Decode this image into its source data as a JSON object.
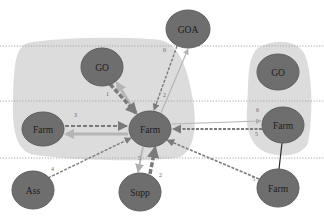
{
  "diagram": {
    "type": "network-flow",
    "colors": {
      "node_fill": "#6e6e6e",
      "node_stroke": "#5a5a5a",
      "region_fill": "#dcdcdc",
      "dotted_line": "#9a9a9a",
      "edge_dark": "#7a7a7a",
      "edge_light": "#b0b0b0",
      "solid_edge": "#2a2a2a"
    },
    "regions": [
      {
        "id": "left-cluster",
        "label": ""
      },
      {
        "id": "right-cluster",
        "label": ""
      }
    ],
    "dotted_guides": [
      {
        "y": 46
      },
      {
        "y": 101
      },
      {
        "y": 158
      }
    ],
    "nodes": [
      {
        "id": "goa",
        "label": "GOA",
        "cx": 188,
        "cy": 29,
        "rx": 22,
        "ry": 19
      },
      {
        "id": "go-left",
        "label": "GO",
        "cx": 102,
        "cy": 67,
        "rx": 21,
        "ry": 19
      },
      {
        "id": "go-right",
        "label": "GO",
        "cx": 278,
        "cy": 72,
        "rx": 21,
        "ry": 18
      },
      {
        "id": "farm-left",
        "label": "Farm",
        "cx": 43,
        "cy": 129,
        "rx": 21,
        "ry": 17
      },
      {
        "id": "farm-center",
        "label": "Farm",
        "cx": 150,
        "cy": 129,
        "rx": 21,
        "ry": 18
      },
      {
        "id": "farm-right",
        "label": "Farm",
        "cx": 283,
        "cy": 125,
        "rx": 21,
        "ry": 18
      },
      {
        "id": "ass",
        "label": "Ass",
        "cx": 33,
        "cy": 190,
        "rx": 21,
        "ry": 19
      },
      {
        "id": "supp",
        "label": "Supp",
        "cx": 140,
        "cy": 192,
        "rx": 21,
        "ry": 19
      },
      {
        "id": "farm-bottom",
        "label": "Farm",
        "cx": 278,
        "cy": 188,
        "rx": 21,
        "ry": 19
      }
    ],
    "edges": [
      {
        "from": "go-left",
        "to": "farm-center",
        "style": "thick-dashed",
        "label": "1"
      },
      {
        "from": "farm-center",
        "to": "go-left",
        "style": "thick-light",
        "label": ""
      },
      {
        "from": "farm-left",
        "to": "farm-center",
        "style": "dashed",
        "label": "3"
      },
      {
        "from": "farm-center",
        "to": "farm-left",
        "style": "thick-light",
        "label": ""
      },
      {
        "from": "ass",
        "to": "farm-center",
        "style": "dashed",
        "label": "4"
      },
      {
        "from": "supp",
        "to": "farm-center",
        "style": "thick-dashed",
        "label": "2"
      },
      {
        "from": "farm-center",
        "to": "supp",
        "style": "light",
        "label": "5"
      },
      {
        "from": "goa",
        "to": "farm-center",
        "style": "dashed",
        "label": "6"
      },
      {
        "from": "farm-center",
        "to": "goa",
        "style": "light",
        "label": ""
      },
      {
        "from": "farm-right",
        "to": "farm-center",
        "style": "dashed",
        "label": "5"
      },
      {
        "from": "farm-center",
        "to": "farm-right",
        "style": "light",
        "label": "6"
      },
      {
        "from": "farm-bottom",
        "to": "farm-center",
        "style": "dashed",
        "label": "5"
      },
      {
        "from": "farm-right",
        "to": "farm-bottom",
        "style": "solid",
        "label": ""
      }
    ],
    "edge_labels": [
      {
        "text": "1",
        "x": 106,
        "y": 96
      },
      {
        "text": "3",
        "x": 74,
        "y": 117
      },
      {
        "text": "4",
        "x": 51,
        "y": 171
      },
      {
        "text": "2",
        "x": 159,
        "y": 177
      },
      {
        "text": "5",
        "x": 138,
        "y": 160
      },
      {
        "text": "6",
        "x": 163,
        "y": 52
      },
      {
        "text": "2",
        "x": 163,
        "y": 97
      },
      {
        "text": "5",
        "x": 255,
        "y": 136
      },
      {
        "text": "6",
        "x": 256,
        "y": 112
      },
      {
        "text": "5",
        "x": 252,
        "y": 181
      }
    ]
  }
}
